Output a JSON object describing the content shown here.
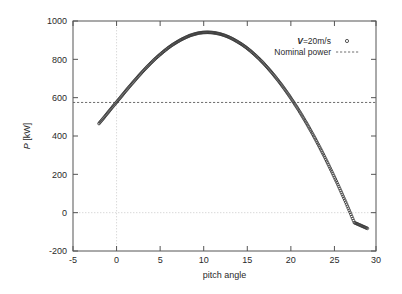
{
  "chart_data": {
    "type": "scatter",
    "title": "",
    "xlabel": "pitch angle",
    "ylabel": "P [kW]",
    "ylabel_parts": {
      "symbol": "P",
      "unit": "[kW]"
    },
    "xlim": [
      -5,
      30
    ],
    "ylim": [
      -200,
      1000
    ],
    "xticks": [
      -5,
      0,
      5,
      10,
      15,
      20,
      25,
      30
    ],
    "xtick_labels": [
      "-5",
      "0",
      "5",
      "10",
      "15",
      "20",
      "25",
      "30"
    ],
    "yticks": [
      -200,
      0,
      200,
      400,
      600,
      800,
      1000
    ],
    "ytick_labels": [
      "-200",
      "0",
      "200",
      "400",
      "600",
      "800",
      "1000"
    ],
    "grid": "x=0 and y=0 only",
    "gridlines_x": [
      0
    ],
    "gridlines_y": [
      0
    ],
    "legend_position": "upper right inside plot",
    "series": [
      {
        "name": "V=20m/s",
        "name_symbol": "V",
        "name_rest": "=20m/s",
        "marker": "open-circle",
        "color": "#3b3b3b",
        "x": [
          -2.0,
          -1.5,
          -1.0,
          -0.5,
          0.0,
          0.5,
          1.0,
          1.5,
          2.0,
          2.5,
          3.0,
          3.5,
          4.0,
          4.5,
          5.0,
          5.5,
          6.0,
          6.5,
          7.0,
          7.5,
          8.0,
          8.5,
          9.0,
          9.5,
          10.0,
          10.5,
          11.0,
          11.5,
          12.0,
          12.5,
          13.0,
          13.5,
          14.0,
          14.5,
          15.0,
          15.5,
          16.0,
          16.5,
          17.0,
          17.5,
          18.0,
          18.5,
          19.0,
          19.5,
          20.0,
          20.5,
          21.0,
          21.5,
          22.0,
          22.5,
          23.0,
          23.5,
          24.0,
          24.5,
          25.0,
          25.5,
          26.0,
          26.5,
          27.0,
          27.5,
          28.0,
          28.5,
          29.0
        ],
        "y": [
          465,
          492,
          520,
          548,
          575,
          602,
          630,
          657,
          683,
          709,
          734,
          758,
          781,
          803,
          823,
          842,
          860,
          876,
          890,
          903,
          914,
          924,
          931,
          937,
          940,
          941,
          940,
          937,
          932,
          925,
          916,
          905,
          892,
          878,
          862,
          844,
          824,
          803,
          780,
          755,
          729,
          701,
          672,
          641,
          609,
          575,
          540,
          503,
          465,
          425,
          384,
          341,
          297,
          251,
          204,
          156,
          106,
          55,
          2,
          -52,
          -62,
          -72,
          -82
        ]
      },
      {
        "name": "Nominal power",
        "type": "horizontal-line",
        "value": 575,
        "style": "dashed",
        "color": "#4a4a4a"
      }
    ]
  },
  "legend": {
    "entries": [
      {
        "label_symbol": "V",
        "label_rest": "=20m/s",
        "marker": "open-circle"
      },
      {
        "label": "Nominal power",
        "marker": "dashed-line"
      }
    ]
  }
}
